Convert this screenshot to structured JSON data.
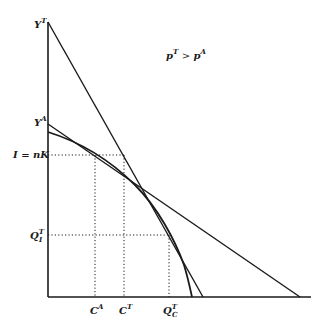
{
  "diagram": {
    "title_condition": {
      "lhs": "p",
      "lhs_sup": "T",
      "op": ">",
      "rhs": "p",
      "rhs_sup": "A"
    },
    "y_axis_labels": {
      "yt": {
        "base": "Y",
        "sup": "T"
      },
      "ya": {
        "base": "Y",
        "sup": "A"
      },
      "investment": {
        "text": "I = nK"
      },
      "qit": {
        "base": "Q",
        "sup": "T",
        "sub": "I"
      }
    },
    "x_axis_labels": {
      "ca": {
        "base": "C",
        "sup": "A"
      },
      "ct": {
        "base": "C",
        "sup": "T"
      },
      "qct": {
        "base": "Q",
        "sup": "T",
        "sub": "C"
      }
    },
    "colors": {
      "ink": "#1a1a1a",
      "background": "#ffffff"
    }
  }
}
